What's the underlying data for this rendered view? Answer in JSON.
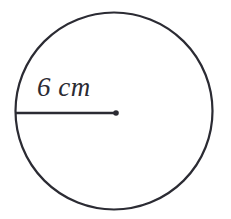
{
  "figure": {
    "type": "geometry-diagram",
    "shape": "circle",
    "background_color": "#ffffff",
    "stroke_color": "#2b2b33",
    "stroke_width": 2,
    "circle": {
      "center_x": 114,
      "center_y": 111,
      "radius_px": 99
    },
    "center_point": {
      "x": 116,
      "y": 113,
      "dot_radius": 3
    },
    "radius_segment": {
      "x1": 16,
      "y1": 113,
      "x2": 116,
      "y2": 113
    },
    "radius_label": {
      "value": "6",
      "unit": "cm",
      "text": "6 cm"
    }
  }
}
